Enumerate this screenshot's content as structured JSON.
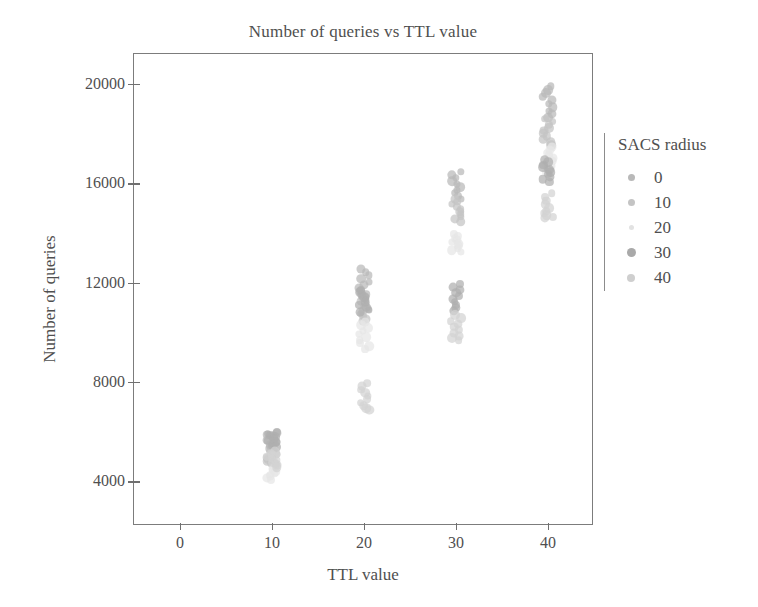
{
  "chart_data": {
    "type": "scatter",
    "title": "Number of queries vs TTL value",
    "xlabel": "TTL value",
    "ylabel": "Number of queries",
    "xlim": [
      -5,
      45
    ],
    "ylim": [
      2200,
      21200
    ],
    "xticks": [
      0,
      10,
      20,
      30,
      40
    ],
    "yticks": [
      4000,
      8000,
      12000,
      16000,
      20000
    ],
    "xtick_labels": [
      "0",
      "10",
      "20",
      "30",
      "40"
    ],
    "ytick_labels": [
      "4000",
      "8000",
      "12000",
      "16000",
      "20000"
    ],
    "grid": false,
    "legend": {
      "title": "SACS radius",
      "position": "right",
      "entries": [
        {
          "label": "0",
          "value": 0,
          "color": "#b9b9b9",
          "size": 7
        },
        {
          "label": "10",
          "value": 10,
          "color": "#c4c4c4",
          "size": 7
        },
        {
          "label": "20",
          "value": 20,
          "color": "#e2e2e2",
          "size": 5
        },
        {
          "label": "30",
          "value": 30,
          "color": "#a9a9a9",
          "size": 9
        },
        {
          "label": "40",
          "value": 40,
          "color": "#cfcfcf",
          "size": 8
        }
      ]
    },
    "series": [
      {
        "name": "SACS radius 0",
        "color": "#b9b9b9",
        "points": [
          [
            10,
            5950
          ],
          [
            10,
            5880
          ],
          [
            10,
            5810
          ],
          [
            10,
            5740
          ],
          [
            10,
            5670
          ],
          [
            10,
            5600
          ],
          [
            10,
            5530
          ],
          [
            10,
            5460
          ],
          [
            10,
            5390
          ],
          [
            10,
            5320
          ],
          [
            20,
            12550
          ],
          [
            20,
            12420
          ],
          [
            20,
            12290
          ],
          [
            20,
            12160
          ],
          [
            20,
            12030
          ],
          [
            20,
            11900
          ],
          [
            20,
            11780
          ],
          [
            20,
            11650
          ],
          [
            20,
            11520
          ],
          [
            20,
            11400
          ],
          [
            30,
            16450
          ],
          [
            30,
            16330
          ],
          [
            30,
            16210
          ],
          [
            30,
            16090
          ],
          [
            30,
            15970
          ],
          [
            30,
            15850
          ],
          [
            30,
            15730
          ],
          [
            30,
            15610
          ],
          [
            30,
            15490
          ],
          [
            30,
            15370
          ],
          [
            40,
            19900
          ],
          [
            40,
            19760
          ],
          [
            40,
            19620
          ],
          [
            40,
            19480
          ],
          [
            40,
            19340
          ],
          [
            40,
            19200
          ],
          [
            40,
            19060
          ],
          [
            40,
            18920
          ],
          [
            40,
            18780
          ],
          [
            40,
            18640
          ]
        ]
      },
      {
        "name": "SACS radius 10",
        "color": "#c4c4c4",
        "points": [
          [
            10,
            5300
          ],
          [
            10,
            5230
          ],
          [
            10,
            5160
          ],
          [
            10,
            5090
          ],
          [
            10,
            5020
          ],
          [
            10,
            4950
          ],
          [
            10,
            4880
          ],
          [
            10,
            4810
          ],
          [
            10,
            4740
          ],
          [
            10,
            4670
          ],
          [
            20,
            11350
          ],
          [
            20,
            11250
          ],
          [
            20,
            11150
          ],
          [
            20,
            11050
          ],
          [
            20,
            10950
          ],
          [
            20,
            10850
          ],
          [
            20,
            10750
          ],
          [
            20,
            10650
          ],
          [
            20,
            10550
          ],
          [
            20,
            10450
          ],
          [
            30,
            15350
          ],
          [
            30,
            15250
          ],
          [
            30,
            15150
          ],
          [
            30,
            15050
          ],
          [
            30,
            14950
          ],
          [
            30,
            14850
          ],
          [
            30,
            14750
          ],
          [
            30,
            14650
          ],
          [
            30,
            14550
          ],
          [
            30,
            14450
          ],
          [
            40,
            18600
          ],
          [
            40,
            18480
          ],
          [
            40,
            18360
          ],
          [
            40,
            18240
          ],
          [
            40,
            18120
          ],
          [
            40,
            18000
          ],
          [
            40,
            17880
          ],
          [
            40,
            17760
          ],
          [
            40,
            17640
          ],
          [
            40,
            17520
          ]
        ]
      },
      {
        "name": "SACS radius 20",
        "color": "#e6e6e6",
        "points": [
          [
            10,
            4620
          ],
          [
            10,
            4560
          ],
          [
            10,
            4500
          ],
          [
            10,
            4440
          ],
          [
            10,
            4380
          ],
          [
            10,
            4320
          ],
          [
            10,
            4260
          ],
          [
            10,
            4200
          ],
          [
            10,
            4130
          ],
          [
            10,
            4060
          ],
          [
            20,
            10400
          ],
          [
            20,
            10280
          ],
          [
            20,
            10160
          ],
          [
            20,
            10040
          ],
          [
            20,
            9920
          ],
          [
            20,
            9800
          ],
          [
            20,
            9680
          ],
          [
            20,
            9560
          ],
          [
            20,
            9440
          ],
          [
            20,
            9320
          ],
          [
            30,
            13950
          ],
          [
            30,
            13870
          ],
          [
            30,
            13790
          ],
          [
            30,
            13710
          ],
          [
            30,
            13630
          ],
          [
            30,
            13550
          ],
          [
            30,
            13470
          ],
          [
            30,
            13390
          ],
          [
            30,
            13310
          ],
          [
            30,
            13230
          ],
          [
            40,
            17450
          ],
          [
            40,
            17340
          ],
          [
            40,
            17230
          ],
          [
            40,
            17120
          ],
          [
            40,
            17010
          ],
          [
            40,
            16900
          ],
          [
            40,
            16790
          ],
          [
            40,
            16680
          ],
          [
            40,
            16570
          ],
          [
            40,
            16460
          ]
        ]
      },
      {
        "name": "SACS radius 30",
        "color": "#aeaeae",
        "points": [
          [
            10,
            5990
          ],
          [
            10,
            5920
          ],
          [
            10,
            5850
          ],
          [
            10,
            5780
          ],
          [
            10,
            5710
          ],
          [
            10,
            5640
          ],
          [
            10,
            5570
          ],
          [
            10,
            5500
          ],
          [
            10,
            5430
          ],
          [
            10,
            5360
          ],
          [
            20,
            11700
          ],
          [
            20,
            11600
          ],
          [
            20,
            11500
          ],
          [
            20,
            11400
          ],
          [
            20,
            11300
          ],
          [
            20,
            11200
          ],
          [
            20,
            11100
          ],
          [
            20,
            11000
          ],
          [
            20,
            10900
          ],
          [
            20,
            10800
          ],
          [
            30,
            11950
          ],
          [
            30,
            11830
          ],
          [
            30,
            11710
          ],
          [
            30,
            11590
          ],
          [
            30,
            11470
          ],
          [
            30,
            11350
          ],
          [
            30,
            11230
          ],
          [
            30,
            11110
          ],
          [
            30,
            10990
          ],
          [
            30,
            10870
          ],
          [
            40,
            16950
          ],
          [
            40,
            16850
          ],
          [
            40,
            16750
          ],
          [
            40,
            16650
          ],
          [
            40,
            16550
          ],
          [
            40,
            16450
          ],
          [
            40,
            16350
          ],
          [
            40,
            16250
          ],
          [
            40,
            16150
          ],
          [
            40,
            16050
          ]
        ]
      },
      {
        "name": "SACS radius 40",
        "color": "#d3d3d3",
        "points": [
          [
            10,
            5200
          ],
          [
            10,
            5130
          ],
          [
            10,
            5060
          ],
          [
            10,
            4990
          ],
          [
            10,
            4920
          ],
          [
            10,
            4850
          ],
          [
            10,
            4780
          ],
          [
            10,
            4710
          ],
          [
            10,
            4640
          ],
          [
            10,
            4570
          ],
          [
            20,
            7950
          ],
          [
            20,
            7820
          ],
          [
            20,
            7690
          ],
          [
            20,
            7560
          ],
          [
            20,
            7430
          ],
          [
            20,
            7300
          ],
          [
            20,
            7170
          ],
          [
            20,
            7050
          ],
          [
            20,
            6950
          ],
          [
            20,
            6880
          ],
          [
            30,
            10700
          ],
          [
            30,
            10580
          ],
          [
            30,
            10460
          ],
          [
            30,
            10340
          ],
          [
            30,
            10220
          ],
          [
            30,
            10100
          ],
          [
            30,
            9980
          ],
          [
            30,
            9860
          ],
          [
            30,
            9760
          ],
          [
            30,
            9680
          ],
          [
            40,
            15600
          ],
          [
            40,
            15450
          ],
          [
            40,
            15300
          ],
          [
            40,
            15150
          ],
          [
            40,
            15000
          ],
          [
            40,
            14880
          ],
          [
            40,
            14780
          ],
          [
            40,
            14700
          ],
          [
            40,
            14640
          ],
          [
            40,
            14590
          ]
        ]
      }
    ]
  }
}
